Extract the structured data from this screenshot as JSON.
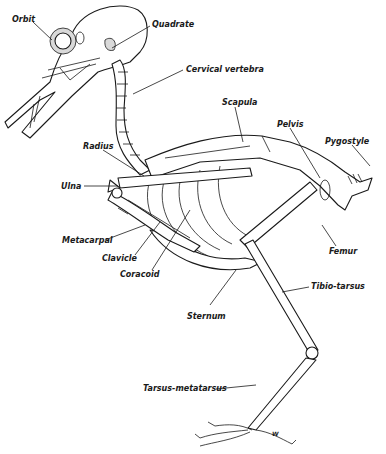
{
  "figure": {
    "signature": "W",
    "labels": [
      {
        "id": "orbit",
        "text": "Orbit",
        "x": 12,
        "y": 16
      },
      {
        "id": "quadrate",
        "text": "Quadrate",
        "x": 152,
        "y": 21
      },
      {
        "id": "cervical-vertebra",
        "text": "Cervical vertebra",
        "x": 186,
        "y": 66
      },
      {
        "id": "scapula",
        "text": "Scapula",
        "x": 222,
        "y": 99
      },
      {
        "id": "pelvis",
        "text": "Pelvis",
        "x": 277,
        "y": 121
      },
      {
        "id": "pygostyle",
        "text": "Pygostyle",
        "x": 325,
        "y": 138
      },
      {
        "id": "radius",
        "text": "Radius",
        "x": 83,
        "y": 143
      },
      {
        "id": "ulna",
        "text": "Ulna",
        "x": 61,
        "y": 183
      },
      {
        "id": "metacarpal",
        "text": "Metacarpal",
        "x": 62,
        "y": 237
      },
      {
        "id": "clavicle",
        "text": "Clavicle",
        "x": 102,
        "y": 255
      },
      {
        "id": "coracoid",
        "text": "Coracoid",
        "x": 120,
        "y": 271
      },
      {
        "id": "femur",
        "text": "Femur",
        "x": 329,
        "y": 248
      },
      {
        "id": "sternum",
        "text": "Sternum",
        "x": 187,
        "y": 313
      },
      {
        "id": "tibio-tarsus",
        "text": "Tibio-tarsus",
        "x": 311,
        "y": 283
      },
      {
        "id": "tarsus-metatarsus",
        "text": "Tarsus-metatarsus",
        "x": 143,
        "y": 385
      }
    ]
  }
}
